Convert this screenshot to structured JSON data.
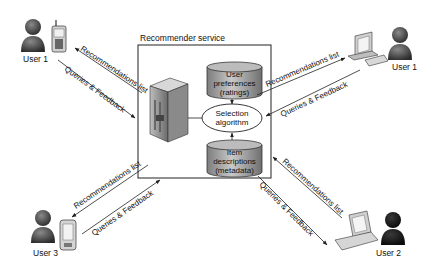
{
  "diagram": {
    "title": "Recommender service",
    "components": {
      "user_preferences": {
        "line1": "User",
        "line2": "preferences",
        "line3": "(ratings)"
      },
      "selection_algorithm": {
        "line1": "Selection",
        "line2": "algorithm"
      },
      "item_descriptions": {
        "line1": "Item",
        "line2": "descriptions",
        "line3": "(metadata)"
      }
    },
    "users": [
      {
        "id": "top-left",
        "label": "User 1",
        "device": "mobile-phone"
      },
      {
        "id": "top-right",
        "label": "User 1",
        "device": "desktop-computer"
      },
      {
        "id": "bottom-left",
        "label": "User 3",
        "device": "pda"
      },
      {
        "id": "bottom-right",
        "label": "User 2",
        "device": "laptop"
      }
    ],
    "edges": {
      "recommendations": "Recommendations list",
      "queries": "Queries & Feedback"
    },
    "colors": {
      "stroke": "#222222",
      "cylinder_fill": "#9a9a9a",
      "user_body": "#3a3a3a",
      "background": "#ffffff"
    }
  }
}
